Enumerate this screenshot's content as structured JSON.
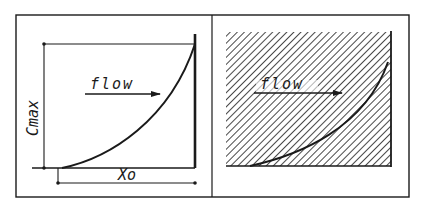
{
  "figure": {
    "colors": {
      "ink": "#1a1a1a",
      "background": "#ffffff"
    },
    "left_panel": {
      "flow_label": "flow",
      "vertical_dimension_label": "Cmax",
      "horizontal_dimension_label": "Xo"
    },
    "right_panel": {
      "flow_label": "flow",
      "fill": "diagonal-hatch"
    }
  }
}
